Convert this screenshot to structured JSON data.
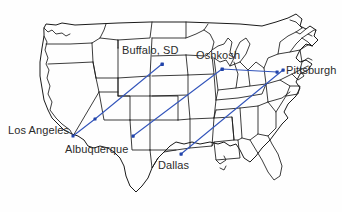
{
  "figure": {
    "type": "map",
    "region": "United States",
    "background_color": "#fefefe",
    "border_color": "#1a1a1a",
    "route_color": "#3355bb",
    "marker_color": "#2244aa",
    "label_color": "#2b2b2b"
  },
  "cities": [
    {
      "name": "Los Angeles",
      "marker_x": 73,
      "marker_y": 136,
      "label_x": 8,
      "label_y": 125,
      "label_anchor": "right-of-text"
    },
    {
      "name": "Albuquerque",
      "marker_x": 95,
      "marker_y": 119,
      "label_x": 65,
      "label_y": 144,
      "label_anchor": "below"
    },
    {
      "name": "Buffalo, SD",
      "marker_x": 162,
      "marker_y": 64,
      "label_x": 122,
      "label_y": 45,
      "label_anchor": "above"
    },
    {
      "name": "Oshkosh",
      "marker_x": 222,
      "marker_y": 69,
      "label_x": 196,
      "label_y": 50,
      "label_anchor": "above"
    },
    {
      "name": "Pittsburgh",
      "marker_x": 277,
      "marker_y": 72,
      "label_x": 286,
      "label_y": 65,
      "label_anchor": "right"
    },
    {
      "name": "Dallas",
      "marker_x": 181,
      "marker_y": 154,
      "label_x": 158,
      "label_y": 160,
      "label_anchor": "below"
    }
  ],
  "extra_markers": [
    {
      "name": "route-2-origin",
      "x": 133,
      "y": 136
    },
    {
      "name": "route-3-endpoint",
      "x": 283,
      "y": 70
    }
  ],
  "routes": [
    {
      "name": "los-angeles-to-buffalo-sd",
      "from": "Los Angeles",
      "to": "Buffalo, SD",
      "points": "73,136 95,119 162,64"
    },
    {
      "name": "albuquerque-east-to-pittsburgh",
      "from": "Albuquerque area",
      "to": "Pittsburgh",
      "points": "133,136 222,69 277,72"
    },
    {
      "name": "dallas-to-pittsburgh",
      "from": "Dallas",
      "to": "Pittsburgh",
      "points": "181,154 283,70"
    }
  ]
}
